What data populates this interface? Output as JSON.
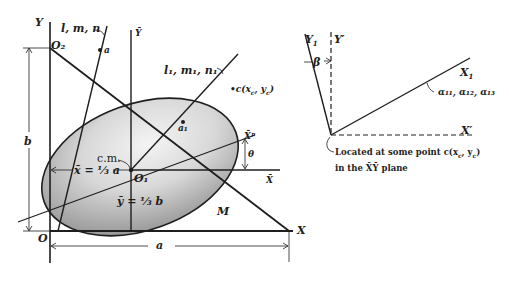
{
  "left_figure": {
    "axes": {
      "y_axis": "Y",
      "x_axis": "X",
      "origin": "O",
      "origin_top": "O₂",
      "y_bar": "Ȳ",
      "x_bar": "X̄",
      "x_bar_p": "X̄ᵖ",
      "center_origin": "O₁"
    },
    "lines": {
      "line_a_label": "l, m, n",
      "point_a": "a",
      "line_a1_label": "l₁, m₁, n₁",
      "point_a1": "a₁"
    },
    "point_c": "•c(x",
    "point_c_sub1": "c",
    "point_c_mid": ", y",
    "point_c_sub2": "c",
    "point_c_end": ")",
    "center_of_mass": "c.m.",
    "x_bar_eq": "x̄ = ⅓ a",
    "y_bar_eq": "ȳ = ⅓ b",
    "angle": "θ",
    "mass": "M",
    "dim_a": "a",
    "dim_b": "b"
  },
  "right_figure": {
    "y1_axis": "Y",
    "y1_sub": "1",
    "y_prime": "Y′",
    "x1_axis": "X",
    "x1_sub": "1",
    "x_prime": "X′",
    "angle_beta": "β",
    "direction_cosines": "α₁₁, α₁₂, α₁₃",
    "note_line1": "Located at some point c(x",
    "note_sub1": "c",
    "note_mid": ", y",
    "note_sub2": "c",
    "note_end": ")",
    "note_line2": "in the X̄Ȳ plane"
  },
  "colors": {
    "ink": "#1e1e1e",
    "shade_dark": "#8c8c8c",
    "shade_light": "#f2f2f2",
    "background": "#ffffff"
  }
}
